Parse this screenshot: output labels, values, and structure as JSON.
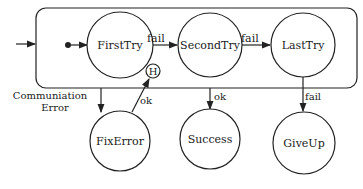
{
  "diagram": {
    "type": "statechart",
    "superstate": {
      "label": ""
    },
    "states": [
      {
        "id": "first",
        "label": "FirstTry"
      },
      {
        "id": "second",
        "label": "SecondTry"
      },
      {
        "id": "last",
        "label": "LastTry"
      },
      {
        "id": "fix",
        "label": "FixError"
      },
      {
        "id": "success",
        "label": "Success"
      },
      {
        "id": "giveup",
        "label": "GiveUp"
      }
    ],
    "history": {
      "label": "H"
    },
    "transitions": [
      {
        "from": "first",
        "to": "second",
        "label": "fail"
      },
      {
        "from": "second",
        "to": "last",
        "label": "fail"
      },
      {
        "from": "superstate",
        "to": "fix",
        "label_line1": "Communiation",
        "label_line2": "Error"
      },
      {
        "from": "fix",
        "to": "history",
        "label": "ok"
      },
      {
        "from": "superstate",
        "to": "success",
        "label": "ok"
      },
      {
        "from": "last",
        "to": "giveup",
        "label": "fail"
      }
    ]
  }
}
